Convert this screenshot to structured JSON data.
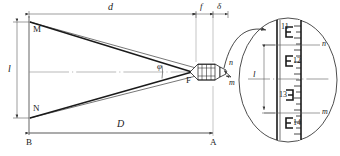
{
  "figure": {
    "type": "optical-distance-measurement-diagram",
    "background_color": "#ffffff",
    "line_color": "#3a3a3a",
    "ray_color": "#1a1a1a",
    "text_color": "#1a1a1a"
  },
  "points": {
    "M": "M",
    "N": "N",
    "B": "B",
    "A": "A",
    "F": "F"
  },
  "dimensions": {
    "d": "d",
    "f": "f",
    "delta": "δ",
    "D": "D",
    "l_left": "l",
    "l_detail": "l"
  },
  "angles": {
    "phi": "φ"
  },
  "stadia_marks": {
    "n_main": "n",
    "m_main": "m",
    "n_detail": "n",
    "m_detail": "m"
  },
  "detail_circle": {
    "graduations": [
      "11",
      "12",
      "13",
      "14"
    ],
    "note": "magnified leveling staff scale"
  }
}
